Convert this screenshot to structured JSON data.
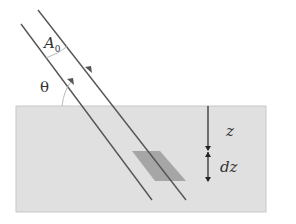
{
  "diagram": {
    "labels": {
      "area": "A",
      "area_subscript": "0",
      "angle": "θ",
      "depth": "z",
      "slice": "dz"
    },
    "colors": {
      "slab_fill": "#e0e0e0",
      "slab_border": "#c8c8c8",
      "slice_fill": "#a6a6a6",
      "beam_line": "#555555",
      "arc": "#bbbbbb"
    }
  }
}
